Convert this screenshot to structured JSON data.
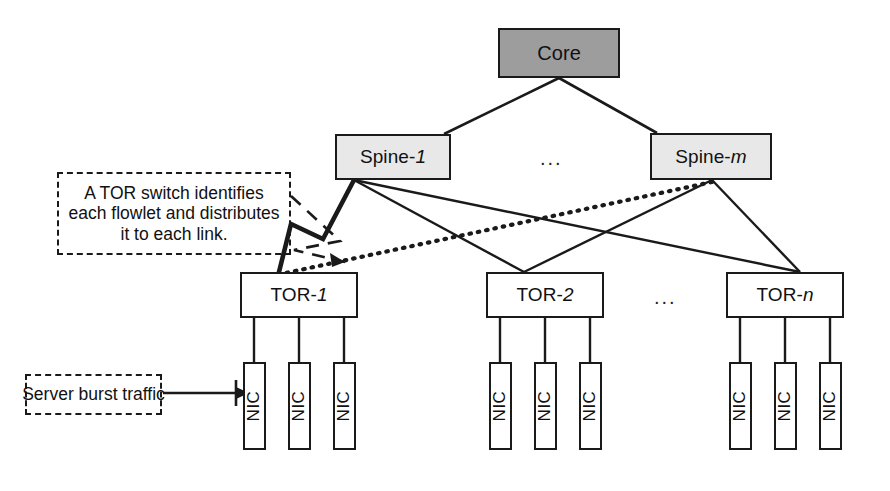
{
  "diagram": {
    "type": "network-topology"
  },
  "nodes": {
    "core": {
      "label": "Core",
      "fill": "#9d9d9d"
    },
    "spines": [
      {
        "label": "Spine-",
        "variable": "1",
        "fill": "#e8e8e8"
      },
      {
        "label": "Spine-",
        "variable": "m",
        "fill": "#e8e8e8"
      }
    ],
    "tors": [
      {
        "label": "TOR-",
        "variable": "1",
        "fill": "#ffffff"
      },
      {
        "label": "TOR-",
        "variable": "2",
        "fill": "#ffffff"
      },
      {
        "label": "TOR-",
        "variable": "n",
        "fill": "#ffffff"
      }
    ],
    "nic_label": "NIC",
    "nics_per_tor": 3
  },
  "ellipses": {
    "spine_row": "...",
    "tor_row": "..."
  },
  "callouts": {
    "tor_switch": {
      "line1": "A TOR switch identifies",
      "line2": "each flowlet and distributes",
      "line3": "it to each link."
    },
    "server_burst": {
      "text": "Server burst traffic"
    }
  },
  "colors": {
    "core_fill": "#9d9d9d",
    "spine_fill": "#e8e8e8",
    "tor_fill": "#ffffff",
    "nic_fill": "#ffffff",
    "stroke": "#1a1a1a",
    "background": "#ffffff"
  },
  "links": {
    "highlighted_flowlet_solid": "Spine-1 to TOR-1 (thick solid)",
    "highlighted_flowlet_dotted": "Spine-m to TOR-1 (dotted)"
  }
}
